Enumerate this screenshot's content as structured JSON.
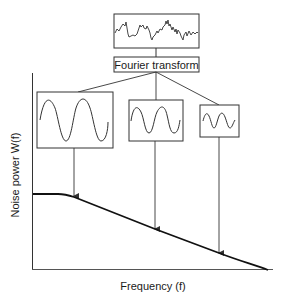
{
  "diagram": {
    "top_signal": {
      "label": "noise-signal"
    },
    "transform_box": {
      "label": "Fourier transform"
    },
    "components": [
      {
        "name": "low-frequency-component",
        "cycles": 2,
        "amplitude": "large"
      },
      {
        "name": "mid-frequency-component",
        "cycles": 2,
        "amplitude": "medium"
      },
      {
        "name": "high-frequency-component",
        "cycles": 2,
        "amplitude": "small"
      }
    ],
    "axes": {
      "ylabel": "Noise power W(f)",
      "xlabel": "Frequency (f)"
    },
    "colors": {
      "line": "#1a1a1a",
      "box_border": "#333333",
      "background": "#ffffff"
    }
  }
}
